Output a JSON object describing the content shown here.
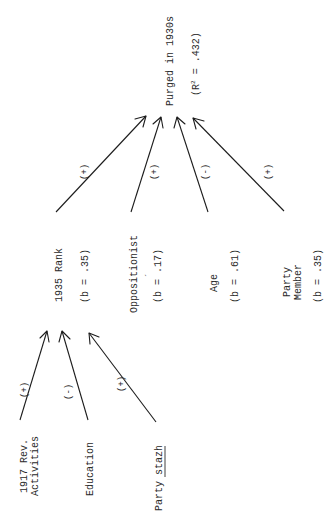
{
  "diagram": {
    "outcome": {
      "label": "Purged in 1930s",
      "stat_prefix": "(R",
      "stat_sup": "2",
      "stat_suffix": " = .432)"
    },
    "intermediate": {
      "label": "1935 Rank",
      "coef": "(b = .35)"
    },
    "predictors": [
      {
        "label": "Oppositionist",
        "coef": "(b = .17)",
        "mark": "´"
      },
      {
        "label": "Age",
        "coef": "(b = .61)"
      },
      {
        "label_line1": "Party",
        "label_line2": "Member",
        "coef": "(b = .35)"
      }
    ],
    "antecedents": [
      {
        "label_line1": "1917 Rev.",
        "label_line2": "Activities"
      },
      {
        "label": "Education"
      },
      {
        "label_plain": "Party ",
        "label_underlined": "stazh"
      }
    ],
    "edges_to_outcome": [
      {
        "from": "1935 Rank",
        "sign": "(+)"
      },
      {
        "from": "Oppositionist",
        "sign": "(+)"
      },
      {
        "from": "Age",
        "sign": "(-)"
      },
      {
        "from": "Party Member",
        "sign": "(+)"
      }
    ],
    "edges_to_rank": [
      {
        "from": "1917 Rev. Activities",
        "sign": "(+)"
      },
      {
        "from": "Education",
        "sign": "(-)"
      },
      {
        "from": "Party stazh",
        "sign": "(+)"
      }
    ]
  }
}
